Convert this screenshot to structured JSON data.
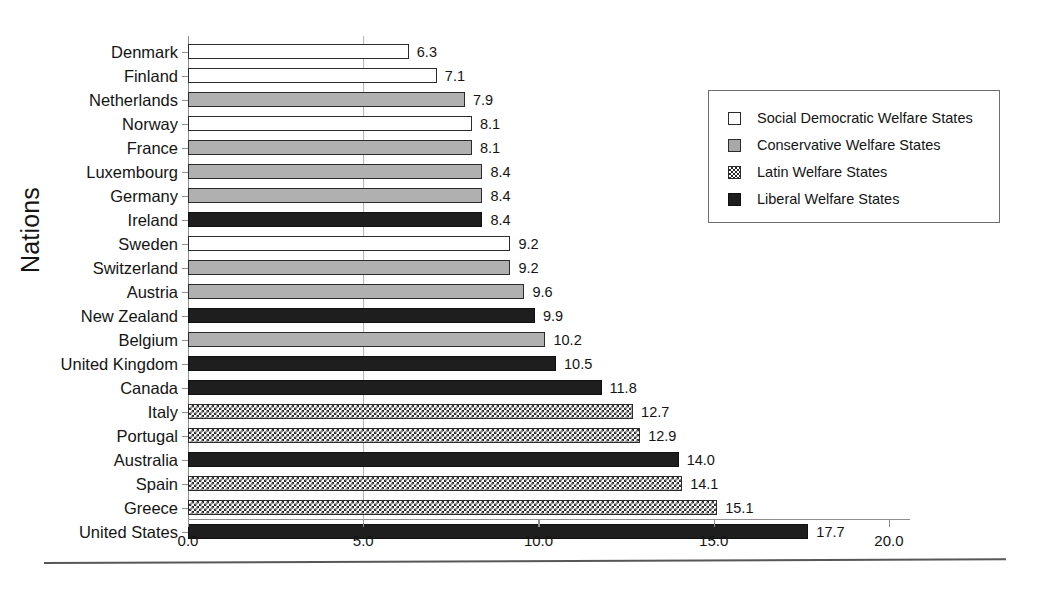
{
  "chart_data": {
    "type": "bar",
    "orientation": "horizontal",
    "title": "",
    "xlabel": "",
    "ylabel": "Nations",
    "xlim": [
      0.0,
      20.6
    ],
    "xticks": [
      "0.0",
      "5.0",
      "10.0",
      "15.0",
      "20.0"
    ],
    "xtick_values": [
      0.0,
      5.0,
      10.0,
      15.0,
      20.0
    ],
    "grid": "vertical-at-5.0",
    "legend_position": "upper-right",
    "categories": [
      "Denmark",
      "Finland",
      "Netherlands",
      "Norway",
      "France",
      "Luxembourg",
      "Germany",
      "Ireland",
      "Sweden",
      "Switzerland",
      "Austria",
      "New Zealand",
      "Belgium",
      "United Kingdom",
      "Canada",
      "Italy",
      "Portugal",
      "Australia",
      "Spain",
      "Greece",
      "United States"
    ],
    "values": [
      6.3,
      7.1,
      7.9,
      8.1,
      8.1,
      8.4,
      8.4,
      8.4,
      9.2,
      9.2,
      9.6,
      9.9,
      10.2,
      10.5,
      11.8,
      12.7,
      12.9,
      14.0,
      14.1,
      15.1,
      17.7
    ],
    "value_labels": [
      "6.3",
      "7.1",
      "7.9",
      "8.1",
      "8.1",
      "8.4",
      "8.4",
      "8.4",
      "9.2",
      "9.2",
      "9.6",
      "9.9",
      "10.2",
      "10.5",
      "11.8",
      "12.7",
      "12.9",
      "14.0",
      "14.1",
      "15.1",
      "17.7"
    ],
    "groups": [
      "social",
      "social",
      "conservative",
      "social",
      "conservative",
      "conservative",
      "conservative",
      "liberal",
      "social",
      "conservative",
      "conservative",
      "liberal",
      "conservative",
      "liberal",
      "liberal",
      "latin",
      "latin",
      "liberal",
      "latin",
      "latin",
      "liberal"
    ]
  },
  "legend": {
    "items": [
      {
        "key": "social",
        "label": "Social Democratic Welfare States"
      },
      {
        "key": "conservative",
        "label": "Conservative Welfare States"
      },
      {
        "key": "latin",
        "label": "Latin Welfare States"
      },
      {
        "key": "liberal",
        "label": "Liberal Welfare States"
      }
    ]
  },
  "colors": {
    "social": "#ffffff",
    "conservative": "#b0b0b0",
    "latin": "#ffffff",
    "liberal": "#1e1e1e",
    "axis": "#8f8f8f",
    "text": "#141414"
  }
}
